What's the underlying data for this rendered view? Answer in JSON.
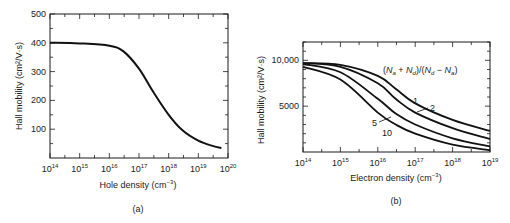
{
  "chart_data": [
    {
      "type": "line",
      "panel": "(a)",
      "title": "",
      "xlabel": "Hole density (cm^-3)",
      "ylabel": "Hall mobility (cm^2/V·s)",
      "xscale": "log",
      "xlim": [
        100000000000000.0,
        1e+20
      ],
      "ylim": [
        0,
        500
      ],
      "xticks": [
        "10^14",
        "10^15",
        "10^16",
        "10^17",
        "10^18",
        "10^19",
        "10^20"
      ],
      "yticks": [
        100,
        200,
        300,
        400,
        500
      ],
      "grid": false,
      "series": [
        {
          "name": "p-type",
          "x": [
            100000000000000.0,
            1000000000000000.0,
            1e+16,
            3e+16,
            1e+17,
            3e+17,
            1e+18,
            3e+18,
            1e+19,
            3e+19,
            6e+19
          ],
          "y": [
            400,
            398,
            390,
            370,
            310,
            230,
            150,
            95,
            60,
            42,
            35
          ]
        }
      ]
    },
    {
      "type": "line",
      "panel": "(b)",
      "title": "",
      "xlabel": "Electron density (cm^-3)",
      "ylabel": "Hall mobility (cm^2/V·s)",
      "xscale": "log",
      "xlim": [
        100000000000000.0,
        1e+19
      ],
      "ylim": [
        0,
        12000
      ],
      "xticks": [
        "10^14",
        "10^15",
        "10^16",
        "10^17",
        "10^18",
        "10^19"
      ],
      "yticks": [
        5000,
        10000
      ],
      "grid": false,
      "legend_title": "(Na + Nd)/(Nd − Na)",
      "series": [
        {
          "name": "1",
          "x": [
            100000000000000.0,
            1000000000000000.0,
            1e+16,
            3e+16,
            1e+17,
            1e+18,
            1e+19
          ],
          "y": [
            9700,
            9500,
            8300,
            6900,
            5300,
            3500,
            2300
          ]
        },
        {
          "name": "2",
          "x": [
            100000000000000.0,
            1000000000000000.0,
            1e+16,
            3e+16,
            1e+17,
            1e+18,
            1e+19
          ],
          "y": [
            9700,
            9300,
            7500,
            5800,
            4300,
            2600,
            1400
          ]
        },
        {
          "name": "5",
          "x": [
            100000000000000.0,
            1000000000000000.0,
            1e+16,
            3e+16,
            1e+17,
            1e+18,
            1e+19
          ],
          "y": [
            9600,
            8700,
            5800,
            4200,
            3000,
            1500,
            600
          ]
        },
        {
          "name": "10",
          "x": [
            100000000000000.0,
            1000000000000000.0,
            1e+16,
            3e+16,
            1e+17,
            1e+18,
            1e+19
          ],
          "y": [
            9300,
            7900,
            4300,
            3000,
            2000,
            800,
            200
          ]
        }
      ]
    }
  ],
  "panel_a": {
    "caption": "(a)",
    "xlabel": "Hole density (cm",
    "xlabel_sup": "−3",
    "xlabel_end": ")",
    "ylabel": "Hall mobility (cm²/V·s)",
    "yticks": [
      "100",
      "200",
      "300",
      "400",
      "500"
    ],
    "xticks_base": "10",
    "xticks_exp": [
      "14",
      "15",
      "16",
      "17",
      "18",
      "19",
      "20"
    ]
  },
  "panel_b": {
    "caption": "(b)",
    "xlabel": "Electron density (cm",
    "xlabel_sup": "−3",
    "xlabel_end": ")",
    "ylabel": "Hall mobility (cm²/V·s)",
    "yticks": [
      "5000",
      "10,000"
    ],
    "xticks_base": "10",
    "xticks_exp": [
      "14",
      "15",
      "16",
      "17",
      "18",
      "19"
    ],
    "legend_title": "(Na + Nd)/(Nd − Na)",
    "curve_labels": [
      "1",
      "2",
      "5",
      "10"
    ]
  }
}
